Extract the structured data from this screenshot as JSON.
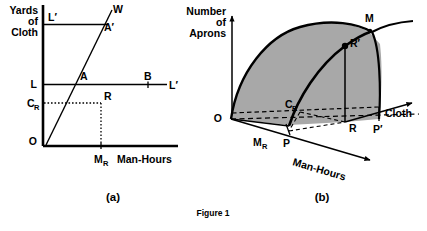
{
  "figure": {
    "caption": "Figure 1",
    "background_color": "#ffffff",
    "ink_color": "#000000",
    "shade_color": "#a8a8a8"
  },
  "panel_a": {
    "tag": "(a)",
    "y_axis_label_lines": [
      "Yards",
      "of",
      "Cloth"
    ],
    "x_axis_label": "Man-Hours",
    "origin_label": "O",
    "labels": {
      "upper_budget_left": "L′",
      "upper_budget_right": "W",
      "upper_intersection": "A′",
      "lower_budget_left": "L",
      "lower_budget_right": "L′",
      "lower_intersection": "A",
      "point_b": "B",
      "point_r": "R",
      "cloth_r": "C",
      "cloth_r_sub": "R",
      "manhours_r": "M",
      "manhours_r_sub": "R"
    }
  },
  "panel_b": {
    "tag": "(b)",
    "y_axis_label_lines": [
      "Number",
      "of",
      "Aprons"
    ],
    "cloth_axis_label": "Cloth",
    "manhours_axis_label": "Man-Hours",
    "origin_label": "O",
    "labels": {
      "maximum": "M",
      "point_r_prime": "R′",
      "point_r": "R",
      "point_p": "P",
      "point_p_prime": "P′",
      "cloth_r": "C",
      "cloth_r_sub": "R",
      "manhours_r": "M",
      "manhours_r_sub": "R"
    }
  }
}
